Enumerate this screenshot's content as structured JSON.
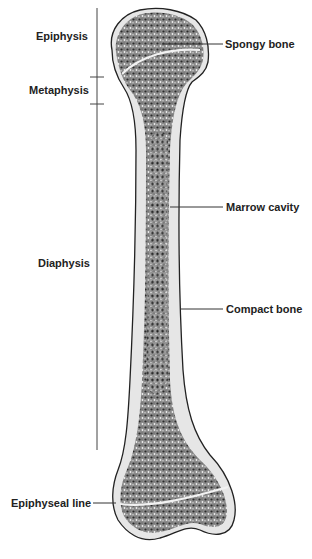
{
  "figure": {
    "region_labels": [
      {
        "id": "epiphysis",
        "text": "Epiphysis"
      },
      {
        "id": "metaphysis",
        "text": "Metaphysis"
      },
      {
        "id": "diaphysis",
        "text": "Diaphysis"
      }
    ],
    "structure_labels": [
      {
        "id": "spongy-bone",
        "text": "Spongy bone"
      },
      {
        "id": "marrow-cavity",
        "text": "Marrow cavity"
      },
      {
        "id": "compact-bone",
        "text": "Compact bone"
      },
      {
        "id": "epiphyseal-line",
        "text": "Epiphyseal line"
      }
    ],
    "colors": {
      "outline": "#222222",
      "spongy_fill": "#6e6e6e",
      "compact_fill": "#e8e8e8",
      "label_text": "#222222"
    }
  }
}
